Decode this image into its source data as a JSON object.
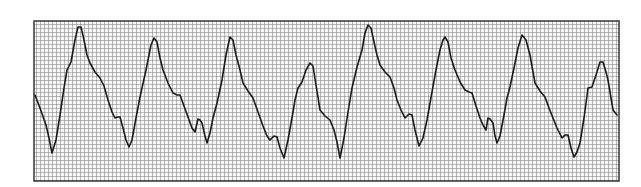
{
  "figure": {
    "type": "ecg-rhythm-strip",
    "grid": {
      "x": 34,
      "y": 21,
      "width": 585,
      "height": 160,
      "cell_px": 4,
      "line_color": "#6f6f6f",
      "border_color": "#2a2a2a",
      "background": "#f7f7f7"
    },
    "trace": {
      "color": "#1a1a1a",
      "stroke_width": 1.6,
      "points": [
        [
          35,
          95
        ],
        [
          40,
          108
        ],
        [
          46,
          125
        ],
        [
          49,
          138
        ],
        [
          52,
          153
        ],
        [
          56,
          140
        ],
        [
          60,
          115
        ],
        [
          64,
          88
        ],
        [
          67,
          70
        ],
        [
          71,
          62
        ],
        [
          75,
          40
        ],
        [
          78,
          27
        ],
        [
          81,
          27
        ],
        [
          84,
          40
        ],
        [
          87,
          55
        ],
        [
          90,
          63
        ],
        [
          95,
          72
        ],
        [
          100,
          78
        ],
        [
          104,
          86
        ],
        [
          108,
          100
        ],
        [
          112,
          112
        ],
        [
          115,
          118
        ],
        [
          118,
          117
        ],
        [
          120,
          117
        ],
        [
          123,
          128
        ],
        [
          126,
          140
        ],
        [
          129,
          147
        ],
        [
          132,
          140
        ],
        [
          136,
          118
        ],
        [
          140,
          97
        ],
        [
          133,
          130
        ],
        [
          136,
          118
        ],
        [
          140,
          97
        ],
        [
          146,
          70
        ],
        [
          151,
          45
        ],
        [
          154,
          38
        ],
        [
          157,
          42
        ],
        [
          160,
          58
        ],
        [
          163,
          70
        ],
        [
          168,
          83
        ],
        [
          173,
          93
        ],
        [
          177,
          95
        ],
        [
          180,
          95
        ],
        [
          184,
          106
        ],
        [
          188,
          117
        ],
        [
          192,
          128
        ],
        [
          195,
          132
        ],
        [
          198,
          119
        ],
        [
          200,
          120
        ],
        [
          202,
          123
        ],
        [
          205,
          136
        ],
        [
          207,
          143
        ],
        [
          210,
          133
        ],
        [
          213,
          118
        ],
        [
          217,
          103
        ],
        [
          222,
          80
        ],
        [
          226,
          55
        ],
        [
          230,
          37
        ],
        [
          233,
          40
        ],
        [
          236,
          55
        ],
        [
          240,
          70
        ],
        [
          243,
          83
        ],
        [
          248,
          91
        ],
        [
          253,
          98
        ],
        [
          258,
          112
        ],
        [
          263,
          126
        ],
        [
          267,
          136
        ],
        [
          270,
          140
        ],
        [
          274,
          136
        ],
        [
          277,
          137
        ],
        [
          280,
          148
        ],
        [
          284,
          158
        ],
        [
          288,
          140
        ],
        [
          292,
          118
        ],
        [
          295,
          100
        ],
        [
          298,
          88
        ],
        [
          302,
          82
        ],
        [
          306,
          70
        ],
        [
          310,
          63
        ],
        [
          313,
          66
        ],
        [
          316,
          85
        ],
        [
          320,
          110
        ],
        [
          325,
          116
        ],
        [
          330,
          120
        ],
        [
          334,
          130
        ],
        [
          337,
          142
        ],
        [
          340,
          158
        ],
        [
          344,
          138
        ],
        [
          348,
          112
        ],
        [
          352,
          88
        ],
        [
          357,
          67
        ],
        [
          362,
          50
        ],
        [
          365,
          33
        ],
        [
          368,
          25
        ],
        [
          371,
          28
        ],
        [
          374,
          42
        ],
        [
          377,
          55
        ],
        [
          380,
          65
        ],
        [
          385,
          72
        ],
        [
          390,
          77
        ],
        [
          394,
          88
        ],
        [
          397,
          100
        ],
        [
          401,
          110
        ],
        [
          405,
          118
        ],
        [
          409,
          114
        ],
        [
          412,
          115
        ],
        [
          415,
          130
        ],
        [
          419,
          146
        ],
        [
          423,
          138
        ],
        [
          427,
          120
        ],
        [
          432,
          92
        ],
        [
          436,
          70
        ],
        [
          440,
          50
        ],
        [
          443,
          40
        ],
        [
          445,
          37
        ],
        [
          448,
          42
        ],
        [
          451,
          58
        ],
        [
          455,
          70
        ],
        [
          460,
          82
        ],
        [
          465,
          90
        ],
        [
          469,
          92
        ],
        [
          472,
          93
        ],
        [
          476,
          106
        ],
        [
          480,
          118
        ],
        [
          483,
          125
        ],
        [
          486,
          130
        ],
        [
          488,
          118
        ],
        [
          490,
          119
        ],
        [
          493,
          123
        ],
        [
          495,
          136
        ],
        [
          497,
          143
        ],
        [
          500,
          136
        ],
        [
          504,
          115
        ],
        [
          507,
          98
        ],
        [
          510,
          87
        ],
        [
          514,
          68
        ],
        [
          518,
          48
        ],
        [
          522,
          35
        ],
        [
          526,
          40
        ],
        [
          530,
          55
        ],
        [
          533,
          72
        ],
        [
          535,
          83
        ],
        [
          540,
          91
        ],
        [
          545,
          97
        ],
        [
          549,
          108
        ],
        [
          553,
          118
        ],
        [
          557,
          128
        ],
        [
          562,
          138
        ],
        [
          565,
          135
        ],
        [
          568,
          135
        ],
        [
          571,
          148
        ],
        [
          574,
          157
        ],
        [
          577,
          152
        ],
        [
          580,
          143
        ],
        [
          584,
          118
        ],
        [
          588,
          88
        ],
        [
          592,
          87
        ],
        [
          596,
          75
        ],
        [
          600,
          62
        ],
        [
          603,
          62
        ],
        [
          606,
          72
        ],
        [
          608,
          80
        ],
        [
          611,
          98
        ],
        [
          613,
          110
        ],
        [
          617,
          115
        ]
      ]
    }
  }
}
